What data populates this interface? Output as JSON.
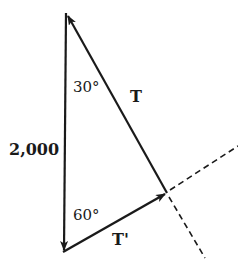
{
  "diagram": {
    "type": "force-vector-triangle",
    "labels": {
      "vertical_force": "2,000",
      "top_angle": "30°",
      "bottom_angle": "60°",
      "tension_T": "T",
      "tension_T_prime": "T'"
    },
    "vertices": {
      "top": [
        66,
        13
      ],
      "bottom": [
        63,
        252
      ],
      "right": [
        167,
        193
      ]
    },
    "colors": {
      "ink": "#1a1a1a",
      "background": "#ffffff"
    }
  }
}
